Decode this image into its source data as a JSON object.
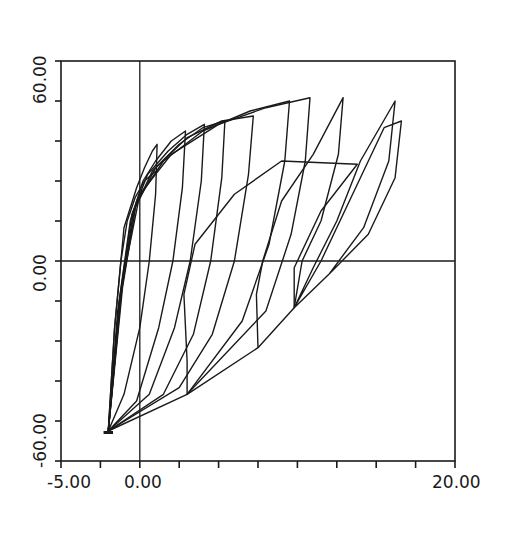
{
  "chart_data": {
    "type": "line",
    "title": "",
    "xlabel": "",
    "ylabel": "",
    "xlim": [
      -5.0,
      20.0
    ],
    "ylim": [
      -60.0,
      60.0
    ],
    "x_tick_labels": [
      "-5.00",
      "0.00",
      "20.00"
    ],
    "y_tick_labels": [
      "60.00",
      "0.00",
      "-60.00"
    ],
    "x_minor_tick_step": 2.5,
    "y_minor_tick_step": 12,
    "grid": false,
    "reference_lines": {
      "x": 0,
      "y": 0
    },
    "line_color": "#1a1a1a",
    "series": [
      {
        "name": "cycle-1",
        "points": [
          [
            -2.0,
            -51
          ],
          [
            -1.6,
            -20
          ],
          [
            -1.0,
            10
          ],
          [
            -0.2,
            22
          ],
          [
            0.3,
            28
          ],
          [
            0.8,
            33
          ],
          [
            1.1,
            35
          ],
          [
            1.0,
            20
          ],
          [
            0.6,
            0
          ],
          [
            0.0,
            -20
          ],
          [
            -1.0,
            -40
          ],
          [
            -2.0,
            -51
          ]
        ]
      },
      {
        "name": "cycle-2",
        "points": [
          [
            -2.0,
            -51
          ],
          [
            -1.4,
            -15
          ],
          [
            -0.6,
            12
          ],
          [
            0.2,
            24
          ],
          [
            1.0,
            30
          ],
          [
            2.0,
            36
          ],
          [
            2.9,
            39
          ],
          [
            2.7,
            22
          ],
          [
            2.1,
            0
          ],
          [
            1.2,
            -20
          ],
          [
            -0.2,
            -42
          ],
          [
            -2.0,
            -51
          ]
        ]
      },
      {
        "name": "cycle-3",
        "points": [
          [
            -2.0,
            -51
          ],
          [
            -1.3,
            -12
          ],
          [
            -0.5,
            14
          ],
          [
            0.5,
            26
          ],
          [
            1.8,
            33
          ],
          [
            3.0,
            38
          ],
          [
            4.1,
            41
          ],
          [
            3.9,
            24
          ],
          [
            3.2,
            0
          ],
          [
            2.2,
            -20
          ],
          [
            0.6,
            -40
          ],
          [
            -2.0,
            -51
          ]
        ]
      },
      {
        "name": "cycle-4",
        "points": [
          [
            -2.0,
            -51
          ],
          [
            -1.2,
            -10
          ],
          [
            -0.4,
            15
          ],
          [
            0.8,
            27
          ],
          [
            2.5,
            35
          ],
          [
            4.0,
            40
          ],
          [
            5.4,
            42
          ],
          [
            5.2,
            25
          ],
          [
            4.5,
            0
          ],
          [
            3.4,
            -22
          ],
          [
            1.5,
            -40
          ],
          [
            -2.0,
            -51
          ]
        ]
      },
      {
        "name": "cycle-5",
        "points": [
          [
            -2.0,
            -51
          ],
          [
            -1.2,
            -10
          ],
          [
            -0.3,
            16
          ],
          [
            1.0,
            28
          ],
          [
            3.0,
            37
          ],
          [
            5.2,
            42
          ],
          [
            7.2,
            43.5
          ],
          [
            6.9,
            26
          ],
          [
            6.0,
            0
          ],
          [
            4.6,
            -22
          ],
          [
            2.5,
            -38
          ],
          [
            -2.0,
            -51
          ]
        ]
      },
      {
        "name": "cycle-6",
        "points": [
          [
            -2.0,
            -51
          ],
          [
            -1.1,
            -8
          ],
          [
            -0.2,
            18
          ],
          [
            1.5,
            30
          ],
          [
            4.0,
            39
          ],
          [
            7.0,
            45
          ],
          [
            9.5,
            48
          ],
          [
            9.2,
            30
          ],
          [
            8.2,
            5
          ],
          [
            6.5,
            -18
          ],
          [
            3.0,
            -40
          ],
          [
            -2.0,
            -51
          ]
        ]
      },
      {
        "name": "cycle-7",
        "points": [
          [
            -2.0,
            -51
          ],
          [
            -1.1,
            -6
          ],
          [
            0.0,
            20
          ],
          [
            2.0,
            32
          ],
          [
            5.0,
            41
          ],
          [
            8.0,
            46
          ],
          [
            10.8,
            49
          ],
          [
            10.5,
            30
          ],
          [
            9.6,
            8
          ],
          [
            8.0,
            -15
          ],
          [
            3.0,
            -40
          ]
        ]
      },
      {
        "name": "cycle-8",
        "points": [
          [
            3.0,
            -40
          ],
          [
            3.0,
            -30
          ],
          [
            2.8,
            -10
          ],
          [
            3.5,
            5
          ],
          [
            6.0,
            20
          ],
          [
            9.0,
            30
          ],
          [
            13.8,
            29
          ],
          [
            11.5,
            15
          ],
          [
            9.8,
            -2
          ],
          [
            9.8,
            -14
          ],
          [
            7.5,
            -26
          ],
          [
            3.0,
            -40
          ]
        ]
      },
      {
        "name": "cycle-9",
        "points": [
          [
            7.5,
            -26
          ],
          [
            7.4,
            -10
          ],
          [
            7.8,
            0
          ],
          [
            9.0,
            18
          ],
          [
            11.0,
            32
          ],
          [
            12.9,
            49
          ],
          [
            12.6,
            32
          ],
          [
            11.5,
            12
          ],
          [
            10.3,
            0
          ],
          [
            9.8,
            -14
          ]
        ]
      },
      {
        "name": "cycle-10",
        "points": [
          [
            9.8,
            -14
          ],
          [
            11.0,
            -2
          ],
          [
            12.5,
            12
          ],
          [
            14.0,
            30
          ],
          [
            16.2,
            48
          ],
          [
            15.8,
            30
          ],
          [
            14.2,
            10
          ],
          [
            12.0,
            -4
          ],
          [
            9.8,
            -14
          ],
          [
            11.5,
            0
          ],
          [
            13.5,
            20
          ],
          [
            15.5,
            40
          ],
          [
            16.6,
            42
          ],
          [
            16.2,
            25
          ],
          [
            14.5,
            8
          ],
          [
            12.0,
            -4
          ]
        ]
      },
      {
        "name": "skeleton",
        "points": [
          [
            -2.0,
            -51
          ],
          [
            -1.6,
            -20
          ],
          [
            -1.2,
            0
          ],
          [
            -0.8,
            12
          ],
          [
            -0.3,
            19
          ],
          [
            0.3,
            24
          ],
          [
            1.0,
            27
          ]
        ]
      }
    ]
  }
}
